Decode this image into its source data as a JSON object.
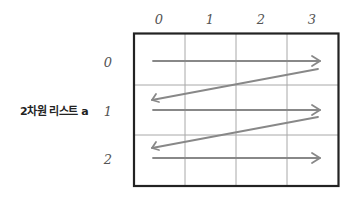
{
  "diagram": {
    "title": "2차원 리스트 a",
    "column_indices": [
      "0",
      "1",
      "2",
      "3"
    ],
    "row_indices": [
      "0",
      "1",
      "2"
    ],
    "grid": {
      "rows": 3,
      "cols": 4,
      "border_color": "#222222",
      "line_color": "#9a9a9a"
    },
    "traversal": {
      "description": "row-major traversal: left-to-right across each row, then wrap back to start of next row",
      "arrow_color": "#8a8a8a",
      "order": [
        {
          "from": [
            0,
            0
          ],
          "to": [
            0,
            3
          ]
        },
        {
          "from": [
            0,
            3
          ],
          "to": [
            1,
            0
          ]
        },
        {
          "from": [
            1,
            0
          ],
          "to": [
            1,
            3
          ]
        },
        {
          "from": [
            1,
            3
          ],
          "to": [
            2,
            0
          ]
        },
        {
          "from": [
            2,
            0
          ],
          "to": [
            2,
            3
          ]
        }
      ]
    }
  }
}
